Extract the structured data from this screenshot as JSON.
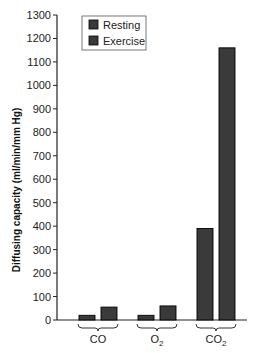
{
  "chart_data": {
    "type": "bar",
    "title": "",
    "xlabel": "",
    "ylabel": "Diffusing capacity (ml/min/mm Hg)",
    "categories": [
      "CO",
      "O2",
      "CO2"
    ],
    "category_display": [
      {
        "base": "CO",
        "sub": ""
      },
      {
        "base": "O",
        "sub": "2"
      },
      {
        "base": "CO",
        "sub": "2"
      }
    ],
    "series": [
      {
        "name": "Resting",
        "values": [
          20,
          20,
          390
        ],
        "color": "#3a3a3a"
      },
      {
        "name": "Exercise",
        "values": [
          55,
          60,
          1160
        ],
        "color": "#3a3a3a"
      }
    ],
    "ylim": [
      0,
      1300
    ],
    "yticks": [
      0,
      100,
      200,
      300,
      400,
      500,
      600,
      700,
      800,
      900,
      1000,
      1100,
      1200,
      1300
    ],
    "grid": false,
    "legend_position": "upper left"
  },
  "legend": {
    "items": [
      {
        "label": "Resting"
      },
      {
        "label": "Exercise"
      }
    ]
  }
}
